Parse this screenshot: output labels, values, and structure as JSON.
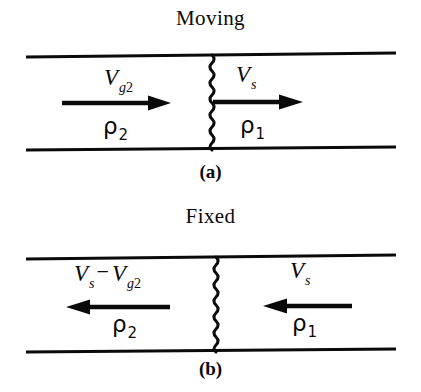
{
  "figure": {
    "kind": "shock-wave-reference-frame-diagram",
    "panels": [
      {
        "id": "a",
        "title": "Moving",
        "caption": "(a)",
        "regions": {
          "left": {
            "density_symbol": "ρ",
            "density_subscript": "2"
          },
          "right": {
            "density_symbol": "ρ",
            "density_subscript": "1"
          }
        },
        "velocity_left": {
          "symbol": "V",
          "subscript": "g",
          "subscript_number": "2",
          "direction": "right"
        },
        "velocity_right": {
          "symbol": "V",
          "subscript": "s",
          "direction": "right"
        }
      },
      {
        "id": "b",
        "title": "Fixed",
        "caption": "(b)",
        "regions": {
          "left": {
            "density_symbol": "ρ",
            "density_subscript": "2"
          },
          "right": {
            "density_symbol": "ρ",
            "density_subscript": "1"
          }
        },
        "velocity_left": {
          "symbol_first": "V",
          "subscript_first": "s",
          "operator": "−",
          "symbol_second": "V",
          "subscript_second": "g",
          "subscript_second_number": "2",
          "direction": "left"
        },
        "velocity_right": {
          "symbol": "V",
          "subscript": "s",
          "direction": "left"
        }
      }
    ],
    "colors": {
      "ink": "#0a0a0a",
      "background": "#ffffff"
    }
  }
}
